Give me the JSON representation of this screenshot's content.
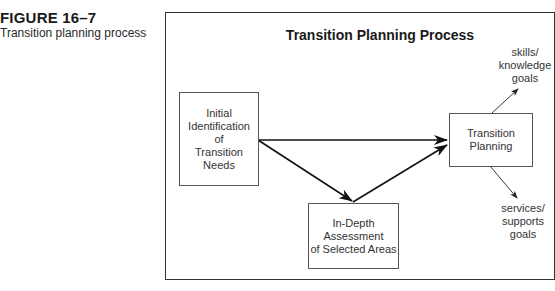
{
  "figure": {
    "label": "FIGURE 16–7",
    "caption": "Transition planning process"
  },
  "diagram": {
    "title": "Transition Planning Process",
    "nodes": [
      {
        "id": "initial",
        "label": "Initial\nIdentification\nof\nTransition\nNeeds"
      },
      {
        "id": "indepth",
        "label": "In-Depth\nAssessment\nof Selected Areas"
      },
      {
        "id": "planning",
        "label": "Transition\nPlanning"
      }
    ],
    "outputs": [
      {
        "id": "skills",
        "label": "skills/\nknowledge\ngoals"
      },
      {
        "id": "services",
        "label": "services/\nsupports\ngoals"
      }
    ],
    "edges": [
      {
        "from": "initial",
        "to": "planning"
      },
      {
        "from": "initial",
        "to": "indepth"
      },
      {
        "from": "indepth",
        "to": "planning"
      },
      {
        "from": "planning",
        "to": "skills"
      },
      {
        "from": "planning",
        "to": "services"
      }
    ]
  }
}
